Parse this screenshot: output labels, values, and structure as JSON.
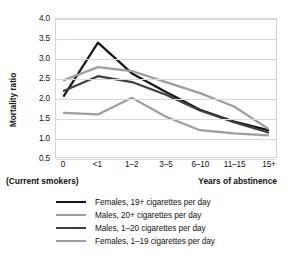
{
  "chart_data": {
    "type": "line",
    "title": "",
    "xlabel": "Years of abstinence",
    "xlabel_secondary": "(Current smokers)",
    "ylabel": "Mortality ratio",
    "categories": [
      "0",
      "<1",
      "1–2",
      "3–5",
      "6–10",
      "11–15",
      "15+"
    ],
    "ylim": [
      0.5,
      4.0
    ],
    "yticks": [
      "4.0",
      "3.5",
      "3.0",
      "2.5",
      "2.0",
      "1.5",
      "1.0",
      "0.5"
    ],
    "ytick_values": [
      4.0,
      3.5,
      3.0,
      2.5,
      2.0,
      1.5,
      1.0,
      0.5
    ],
    "grid": "horizontal",
    "legend_position": "bottom",
    "series": [
      {
        "name": "Females, 19+ cigarettes per day",
        "color": "#161616",
        "width": 2.2,
        "values": [
          2.05,
          3.4,
          2.62,
          2.15,
          1.7,
          1.4,
          1.18
        ]
      },
      {
        "name": "Males, 20+ cigarettes per day",
        "color": "#9d9d9d",
        "width": 2.2,
        "values": [
          2.45,
          2.78,
          2.68,
          2.4,
          2.12,
          1.78,
          1.22
        ]
      },
      {
        "name": "Males, 1–20 cigarettes per day",
        "color": "#3f3f3f",
        "width": 2.2,
        "values": [
          2.18,
          2.55,
          2.4,
          2.08,
          1.68,
          1.38,
          1.12
        ]
      },
      {
        "name": "Females, 1–19 cigarettes per day",
        "color": "#9d9d9d",
        "width": 2.2,
        "values": [
          1.62,
          1.58,
          2.0,
          1.52,
          1.18,
          1.1,
          1.05
        ]
      }
    ]
  },
  "legend": {
    "items": [
      {
        "label": "Females, 19+ cigarettes per day",
        "color": "#161616",
        "width": 2.4
      },
      {
        "label": "Males, 20+ cigarettes per day",
        "color": "#9d9d9d",
        "width": 2.2
      },
      {
        "label": "Males, 1–20 cigarettes per day",
        "color": "#3f3f3f",
        "width": 2.4
      },
      {
        "label": "Females, 1–19 cigarettes per day",
        "color": "#9d9d9d",
        "width": 2.2
      }
    ]
  }
}
